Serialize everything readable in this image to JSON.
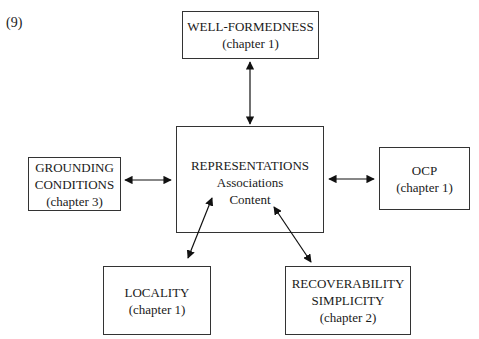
{
  "example_number": "(9)",
  "boxes": {
    "wellformedness": {
      "title": "WELL-FORMEDNESS",
      "chapter": "(chapter 1)"
    },
    "representations": {
      "title": "REPRESENTATIONS",
      "line2": "Associations",
      "line3": "Content"
    },
    "grounding": {
      "line1": "GROUNDING",
      "line2": "CONDITIONS",
      "chapter": "(chapter 3)"
    },
    "ocp": {
      "title": "OCP",
      "chapter": "(chapter 1)"
    },
    "locality": {
      "title": "LOCALITY",
      "chapter": "(chapter 1)"
    },
    "recoverability": {
      "line1": "RECOVERABILITY",
      "line2": "SIMPLICITY",
      "chapter": "(chapter 2)"
    }
  },
  "arrows": [
    {
      "from": "representations",
      "to": "wellformedness",
      "type": "bidirectional"
    },
    {
      "from": "representations",
      "to": "grounding",
      "type": "bidirectional"
    },
    {
      "from": "representations",
      "to": "ocp",
      "type": "bidirectional"
    },
    {
      "from": "representations",
      "to": "locality",
      "type": "bidirectional"
    },
    {
      "from": "representations",
      "to": "recoverability",
      "type": "bidirectional"
    }
  ]
}
